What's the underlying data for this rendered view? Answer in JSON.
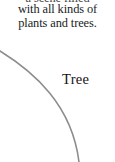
{
  "page": {
    "background_color": "#ffffff",
    "width": 115,
    "height": 162
  },
  "body_text": {
    "text_color": "#201d1d",
    "lines": [
      {
        "id": "line-0",
        "text": "a scene filled",
        "clipped": true
      },
      {
        "id": "line-1",
        "text": "with all kinds of",
        "clipped": false
      },
      {
        "id": "line-2",
        "text": "plants and trees.",
        "clipped": false
      }
    ]
  },
  "illustration": {
    "curve": {
      "name": "tree-canopy-arc",
      "stroke_color": "#8d8d8d",
      "stroke_width": 1.6,
      "start": {
        "x": 0,
        "y": 51
      },
      "end": {
        "x": 79,
        "y": 162
      },
      "control_1": {
        "x": 34,
        "y": 72
      },
      "control_2": {
        "x": 72,
        "y": 105
      }
    }
  },
  "caption": {
    "label": "Tree",
    "text_color": "#151313"
  }
}
